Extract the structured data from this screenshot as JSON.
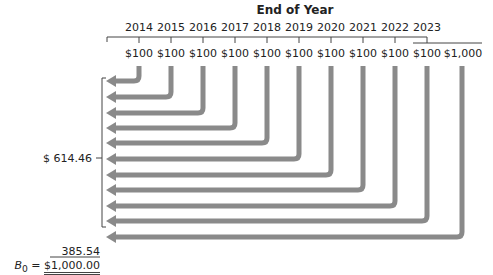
{
  "header": {
    "title": "End of Year"
  },
  "timeline": {
    "years": [
      "2014",
      "2015",
      "2016",
      "2017",
      "2018",
      "2019",
      "2020",
      "2021",
      "2022",
      "2023"
    ],
    "payments": [
      "$100",
      "$100",
      "$100",
      "$100",
      "$100",
      "$100",
      "$100",
      "$100",
      "$100",
      "$100",
      "$1,000"
    ]
  },
  "present_values": {
    "coupons_pv": "$  614.46",
    "principal_pv": "385.54",
    "bond_value_label": "B",
    "bond_value_sub": "0",
    "bond_value_eq": " = ",
    "bond_value": "$1,000.00"
  },
  "colors": {
    "arrow": "#8a8a8a",
    "line": "#444444"
  }
}
